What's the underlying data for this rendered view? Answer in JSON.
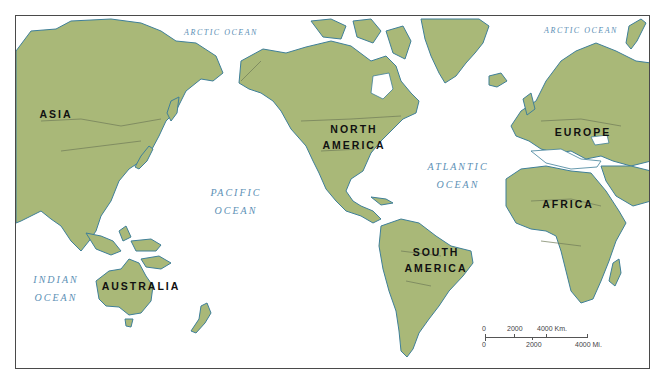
{
  "map": {
    "title": "World map (Pacific-centered)",
    "colors": {
      "land": "#a9b878",
      "coast": "#3f7f98",
      "water": "#ffffff",
      "ocean_label": "#5b8fb5",
      "frame": "#4a4a4a"
    },
    "continents": [
      {
        "id": "asia",
        "lines": [
          "ASIA"
        ]
      },
      {
        "id": "north-america",
        "lines": [
          "NORTH",
          "AMERICA"
        ]
      },
      {
        "id": "south-america",
        "lines": [
          "SOUTH",
          "AMERICA"
        ]
      },
      {
        "id": "europe",
        "lines": [
          "EUROPE"
        ]
      },
      {
        "id": "africa",
        "lines": [
          "AFRICA"
        ]
      },
      {
        "id": "australia",
        "lines": [
          "AUSTRALIA"
        ]
      }
    ],
    "oceans": [
      {
        "id": "arctic-west",
        "lines": [
          "ARCTIC  OCEAN"
        ]
      },
      {
        "id": "arctic-east",
        "lines": [
          "ARCTIC  OCEAN"
        ]
      },
      {
        "id": "pacific",
        "lines": [
          "PACIFIC",
          "OCEAN"
        ]
      },
      {
        "id": "atlantic",
        "lines": [
          "ATLANTIC",
          "OCEAN"
        ]
      },
      {
        "id": "indian",
        "lines": [
          "INDIAN",
          "OCEAN"
        ]
      }
    ],
    "scale_bar": {
      "km_labels": [
        "0",
        "2000",
        "4000 Km."
      ],
      "mi_labels": [
        "0",
        "2000",
        "4000 Mi."
      ]
    }
  }
}
